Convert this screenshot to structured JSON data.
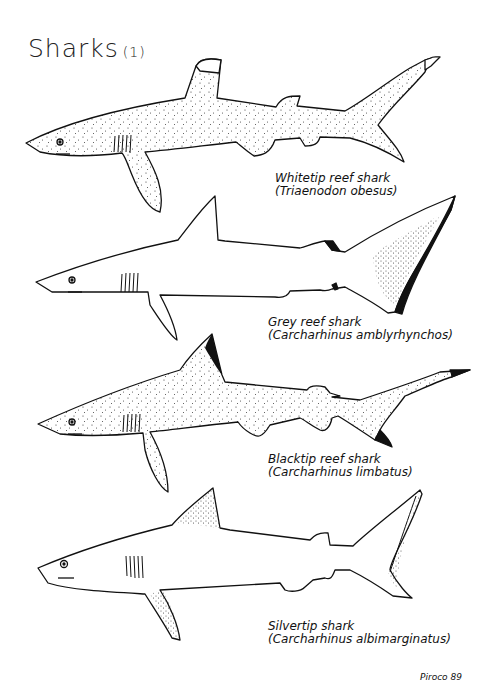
{
  "page": {
    "title": "Sharks",
    "title_number": "(1)",
    "signature": "Piroco 89"
  },
  "colors": {
    "ink": "#111111",
    "background": "#ffffff",
    "stipple": "#333333"
  },
  "sharks": [
    {
      "common_name": "Whitetip reef shark",
      "scientific_name": "(Triaenodon obesus)",
      "marking": "white tips on first dorsal and upper caudal lobe, stippled body"
    },
    {
      "common_name": "Grey reef shark",
      "scientific_name": "(Carcharhinus amblyrhynchos)",
      "marking": "black trailing edge on caudal fin, black tips on second dorsal and anal fin"
    },
    {
      "common_name": "Blacktip reef shark",
      "scientific_name": "(Carcharhinus limbatus)",
      "marking": "black tips on first dorsal, upper and lower caudal lobes, stippled body"
    },
    {
      "common_name": "Silvertip shark",
      "scientific_name": "(Carcharhinus albimarginatus)",
      "marking": "white margins on first dorsal, pectoral and caudal fins"
    }
  ]
}
